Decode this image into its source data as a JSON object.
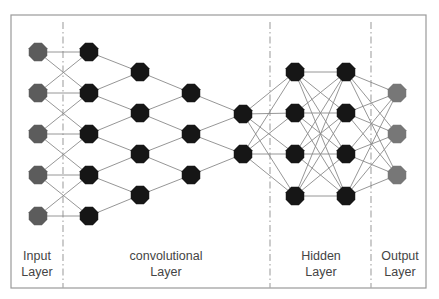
{
  "diagram": {
    "frame": {
      "x": 11,
      "y": 15,
      "width": 415,
      "height": 273,
      "stroke": "#9a9a9a"
    },
    "separators": [
      {
        "name": "input-conv-separator",
        "x": 63
      },
      {
        "name": "conv-hidden-separator",
        "x": 270
      },
      {
        "name": "hidden-output-separator",
        "x": 371
      }
    ],
    "colors": {
      "input_node": "#5c5c5c",
      "hidden_node": "#161616",
      "output_node": "#777777",
      "edge": "#8a8a8a",
      "separator": "#aaaaaa"
    },
    "node_radius": 10,
    "columns": [
      {
        "name": "input",
        "x": 38,
        "ys": [
          52,
          93,
          134,
          175,
          216
        ],
        "color_key": "input_node"
      },
      {
        "name": "conv1",
        "x": 89,
        "ys": [
          52,
          93,
          134,
          175,
          216
        ],
        "color_key": "hidden_node"
      },
      {
        "name": "conv2",
        "x": 140,
        "ys": [
          72,
          113,
          154,
          195
        ],
        "color_key": "hidden_node"
      },
      {
        "name": "conv3",
        "x": 191,
        "ys": [
          93,
          134,
          175
        ],
        "color_key": "hidden_node"
      },
      {
        "name": "conv4",
        "x": 243,
        "ys": [
          114,
          154
        ],
        "color_key": "hidden_node"
      },
      {
        "name": "hidden1",
        "x": 295,
        "ys": [
          72,
          113,
          154,
          196
        ],
        "color_key": "hidden_node"
      },
      {
        "name": "hidden2",
        "x": 346,
        "ys": [
          72,
          113,
          154,
          196
        ],
        "color_key": "hidden_node"
      },
      {
        "name": "output",
        "x": 397,
        "ys": [
          93,
          134,
          175
        ],
        "color_key": "output_node"
      }
    ],
    "connections": [
      {
        "from": 0,
        "to": 1,
        "type": "neighbor"
      },
      {
        "from": 1,
        "to": 2,
        "type": "local"
      },
      {
        "from": 2,
        "to": 3,
        "type": "local"
      },
      {
        "from": 3,
        "to": 4,
        "type": "local"
      },
      {
        "from": 4,
        "to": 5,
        "type": "full"
      },
      {
        "from": 5,
        "to": 6,
        "type": "full"
      },
      {
        "from": 6,
        "to": 7,
        "type": "full"
      }
    ],
    "labels": [
      {
        "name": "input-layer-label",
        "line1": "Input",
        "line2": "Layer",
        "cx": 37
      },
      {
        "name": "convolutional-layer-label",
        "line1": "convolutional",
        "line2": "Layer",
        "cx": 166
      },
      {
        "name": "hidden-layer-label",
        "line1": "Hidden",
        "line2": "Layer",
        "cx": 321
      },
      {
        "name": "output-layer-label",
        "line1": "Output",
        "line2": "Layer",
        "cx": 400
      }
    ],
    "labels_top": 248
  }
}
